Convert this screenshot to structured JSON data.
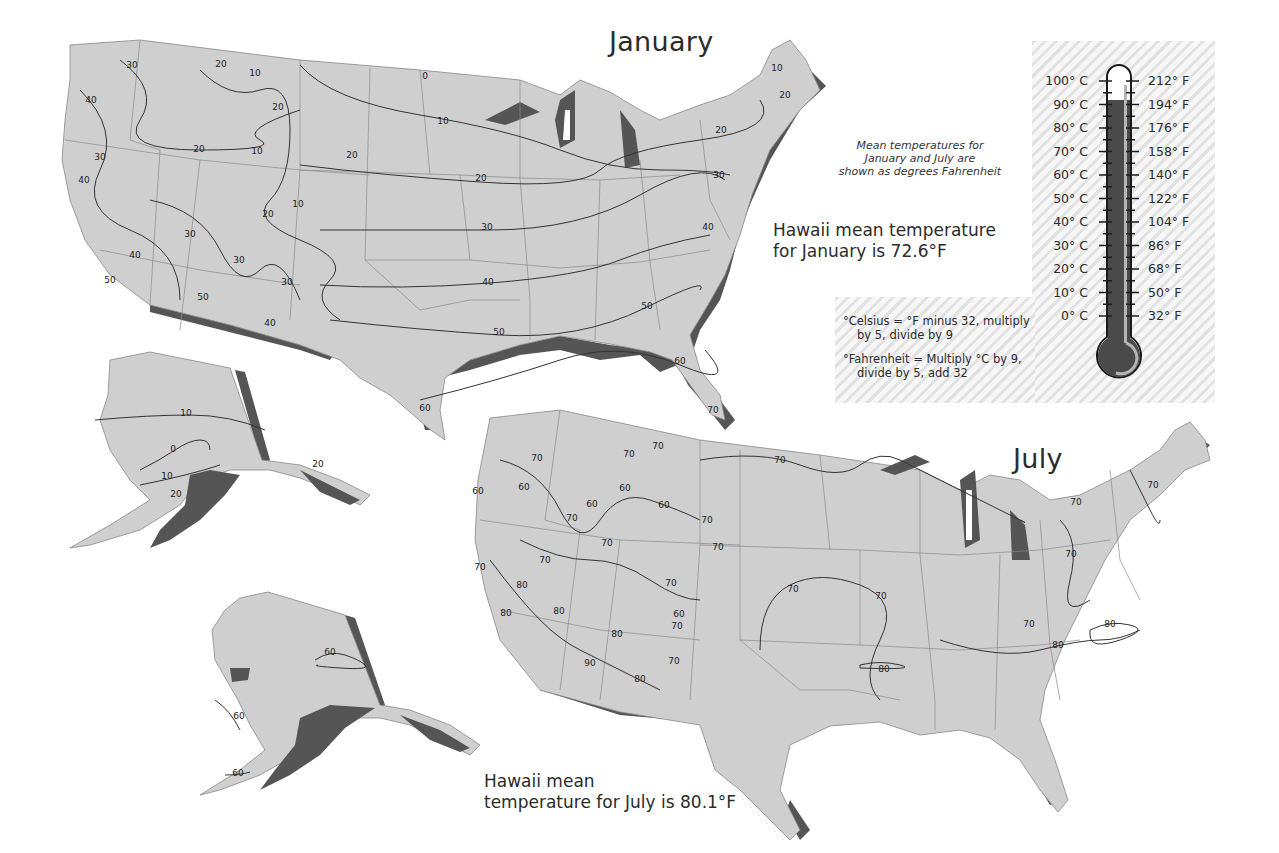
{
  "january": {
    "title": "January",
    "hawaii_note": [
      "Hawaii mean temperature",
      "for January is 72.6°F"
    ],
    "isotherm_labels": [
      {
        "v": "30",
        "x": 132,
        "y": 68
      },
      {
        "v": "20",
        "x": 221,
        "y": 67
      },
      {
        "v": "10",
        "x": 255,
        "y": 76
      },
      {
        "v": "40",
        "x": 91,
        "y": 103
      },
      {
        "v": "20",
        "x": 278,
        "y": 110
      },
      {
        "v": "20",
        "x": 199,
        "y": 152
      },
      {
        "v": "10",
        "x": 257,
        "y": 154
      },
      {
        "v": "20",
        "x": 352,
        "y": 158
      },
      {
        "v": "30",
        "x": 100,
        "y": 160
      },
      {
        "v": "40",
        "x": 84,
        "y": 183
      },
      {
        "v": "10",
        "x": 298,
        "y": 207
      },
      {
        "v": "20",
        "x": 268,
        "y": 217
      },
      {
        "v": "30",
        "x": 190,
        "y": 237
      },
      {
        "v": "40",
        "x": 135,
        "y": 258
      },
      {
        "v": "30",
        "x": 239,
        "y": 263
      },
      {
        "v": "30",
        "x": 287,
        "y": 285
      },
      {
        "v": "50",
        "x": 110,
        "y": 283
      },
      {
        "v": "50",
        "x": 203,
        "y": 300
      },
      {
        "v": "40",
        "x": 270,
        "y": 326
      },
      {
        "v": "0",
        "x": 425,
        "y": 79
      },
      {
        "v": "10",
        "x": 443,
        "y": 124
      },
      {
        "v": "20",
        "x": 481,
        "y": 181
      },
      {
        "v": "30",
        "x": 487,
        "y": 230
      },
      {
        "v": "40",
        "x": 488,
        "y": 285
      },
      {
        "v": "50",
        "x": 499,
        "y": 335
      },
      {
        "v": "50",
        "x": 647,
        "y": 309
      },
      {
        "v": "60",
        "x": 680,
        "y": 364
      },
      {
        "v": "60",
        "x": 425,
        "y": 411
      },
      {
        "v": "70",
        "x": 713,
        "y": 413
      },
      {
        "v": "40",
        "x": 708,
        "y": 230
      },
      {
        "v": "30",
        "x": 719,
        "y": 178
      },
      {
        "v": "20",
        "x": 721,
        "y": 133
      },
      {
        "v": "10",
        "x": 777,
        "y": 71
      },
      {
        "v": "20",
        "x": 785,
        "y": 98
      }
    ]
  },
  "july": {
    "title": "July",
    "hawaii_note": [
      "Hawaii mean",
      "temperature for July is 80.1°F"
    ],
    "isotherm_labels": [
      {
        "v": "70",
        "x": 537,
        "y": 461
      },
      {
        "v": "70",
        "x": 629,
        "y": 457
      },
      {
        "v": "70",
        "x": 658,
        "y": 449
      },
      {
        "v": "70",
        "x": 780,
        "y": 463
      },
      {
        "v": "60",
        "x": 478,
        "y": 494
      },
      {
        "v": "60",
        "x": 524,
        "y": 490
      },
      {
        "v": "60",
        "x": 625,
        "y": 491
      },
      {
        "v": "60",
        "x": 592,
        "y": 507
      },
      {
        "v": "60",
        "x": 664,
        "y": 508
      },
      {
        "v": "70",
        "x": 572,
        "y": 521
      },
      {
        "v": "70",
        "x": 707,
        "y": 523
      },
      {
        "v": "70",
        "x": 607,
        "y": 546
      },
      {
        "v": "70",
        "x": 718,
        "y": 550
      },
      {
        "v": "70",
        "x": 545,
        "y": 563
      },
      {
        "v": "70",
        "x": 480,
        "y": 570
      },
      {
        "v": "80",
        "x": 522,
        "y": 588
      },
      {
        "v": "70",
        "x": 671,
        "y": 586
      },
      {
        "v": "70",
        "x": 793,
        "y": 592
      },
      {
        "v": "70",
        "x": 881,
        "y": 599
      },
      {
        "v": "80",
        "x": 506,
        "y": 616
      },
      {
        "v": "80",
        "x": 559,
        "y": 614
      },
      {
        "v": "60",
        "x": 679,
        "y": 617
      },
      {
        "v": "70",
        "x": 677,
        "y": 629
      },
      {
        "v": "80",
        "x": 617,
        "y": 637
      },
      {
        "v": "90",
        "x": 590,
        "y": 666
      },
      {
        "v": "70",
        "x": 674,
        "y": 664
      },
      {
        "v": "80",
        "x": 640,
        "y": 682
      },
      {
        "v": "80",
        "x": 884,
        "y": 672
      },
      {
        "v": "70",
        "x": 1071,
        "y": 557
      },
      {
        "v": "70",
        "x": 1076,
        "y": 505
      },
      {
        "v": "70",
        "x": 1153,
        "y": 488
      },
      {
        "v": "70",
        "x": 1029,
        "y": 627
      },
      {
        "v": "80",
        "x": 1110,
        "y": 627
      },
      {
        "v": "80",
        "x": 1058,
        "y": 648
      },
      {
        "v": "60",
        "x": 330,
        "y": 655
      },
      {
        "v": "60",
        "x": 239,
        "y": 719
      },
      {
        "v": "60",
        "x": 238,
        "y": 776
      }
    ]
  },
  "alaska_january": {
    "isotherm_labels": [
      {
        "v": "10",
        "x": 186,
        "y": 416
      },
      {
        "v": "0",
        "x": 173,
        "y": 452
      },
      {
        "v": "10",
        "x": 167,
        "y": 479
      },
      {
        "v": "20",
        "x": 176,
        "y": 497
      },
      {
        "v": "20",
        "x": 318,
        "y": 467
      }
    ]
  },
  "legend_note": [
    "Mean temperatures for",
    "January and July are",
    "shown as degrees Fahrenheit"
  ],
  "conversion": {
    "celsius": [
      "°Celsius = °F minus 32, multiply",
      "by 5, divide by 9"
    ],
    "fahrenheit": [
      "°Fahrenheit = Multiply °C by 9,",
      "divide by 5, add 32"
    ]
  },
  "thermometer": {
    "celsius_ticks": [
      "100° C",
      "90° C",
      "80° C",
      "70° C",
      "60° C",
      "50° C",
      "40° C",
      "30° C",
      "20° C",
      "10° C",
      "0° C"
    ],
    "fahrenheit_ticks": [
      "212° F",
      "194° F",
      "176° F",
      "158° F",
      "140° F",
      "122° F",
      "104° F",
      "86° F",
      "68° F",
      "50° F",
      "32° F"
    ],
    "fill_level": "90° C"
  },
  "colors": {
    "land": "#cfcfcf",
    "coast_shadow": "#555555",
    "lines": "#333333",
    "thermo_fill": "#4a4a4a",
    "hatch": "#e4e4e4"
  }
}
